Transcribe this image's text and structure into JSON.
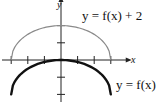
{
  "chart_data": {
    "type": "line",
    "title": "",
    "xlabel": "x",
    "ylabel": "y",
    "xlim": [
      -3.6,
      4.2
    ],
    "ylim": [
      -2.5,
      3.6
    ],
    "x_ticks": [
      -3,
      -2,
      -1,
      0,
      1,
      2,
      3
    ],
    "y_ticks": [
      -2,
      -1,
      0,
      1,
      2
    ],
    "tick_labels_shown": false,
    "grid": false,
    "series": [
      {
        "name": "y = f(x) + 2",
        "color": "#8a8a8a",
        "stroke_width": 1.2,
        "shape": "upper semi-ellipse",
        "points": [
          [
            -3,
            0
          ],
          [
            -2,
            1.49
          ],
          [
            -1,
            1.89
          ],
          [
            0,
            2
          ],
          [
            1,
            1.89
          ],
          [
            2,
            1.49
          ],
          [
            3,
            0
          ]
        ]
      },
      {
        "name": "y = f(x)",
        "color": "#111111",
        "stroke_width": 2.4,
        "shape": "upper semi-ellipse",
        "points": [
          [
            -3,
            -2
          ],
          [
            -2,
            -0.51
          ],
          [
            -1,
            -0.11
          ],
          [
            0,
            0
          ],
          [
            1,
            -0.11
          ],
          [
            2,
            -0.51
          ],
          [
            3,
            -2
          ]
        ]
      }
    ],
    "annotations": [
      {
        "text_pre": "y = ",
        "fn": "f",
        "text_post": "(x) + 2",
        "near_series": "y = f(x) + 2"
      },
      {
        "text_pre": "y = ",
        "fn": "f",
        "text_post": "(x)",
        "near_series": "y = f(x)"
      }
    ]
  },
  "labels": {
    "x_axis": "x",
    "y_axis": "y",
    "upper_curve": "y = f(x) + 2",
    "lower_curve": "y = f(x)"
  }
}
